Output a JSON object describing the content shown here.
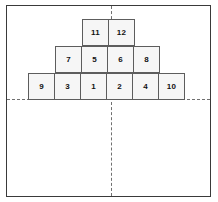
{
  "figure": {
    "title": "",
    "frame": {
      "border_color": "#3a3a3a",
      "background_color": "#ffffff"
    },
    "axes": {
      "horizontal_label": "",
      "vertical_label": "",
      "line_color": "#707070",
      "style": "dashed"
    },
    "block_style": {
      "fill_color": "#f6f6f6",
      "border_color": "#5d5d5d",
      "text_color": "#111111"
    },
    "rows": [
      {
        "name": "bottom-row",
        "blocks": [
          {
            "label": "9"
          },
          {
            "label": "3"
          },
          {
            "label": "1"
          },
          {
            "label": "2"
          },
          {
            "label": "4"
          },
          {
            "label": "10"
          }
        ]
      },
      {
        "name": "middle-row",
        "blocks": [
          {
            "label": "7"
          },
          {
            "label": "5"
          },
          {
            "label": "6"
          },
          {
            "label": "8"
          }
        ]
      },
      {
        "name": "top-row",
        "blocks": [
          {
            "label": "11"
          },
          {
            "label": "12"
          }
        ]
      }
    ]
  }
}
